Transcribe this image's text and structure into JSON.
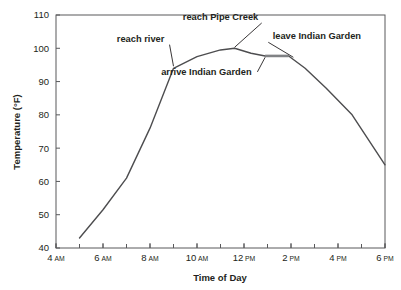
{
  "chart_data": {
    "type": "line",
    "title": "",
    "xlabel": "Time of Day",
    "ylabel": "Temperature (°F)",
    "ylim": [
      40,
      110
    ],
    "xlim": [
      4,
      18
    ],
    "grid": false,
    "legend": "none",
    "y_ticks": [
      40,
      50,
      60,
      70,
      80,
      90,
      100,
      110
    ],
    "y_tick_labels": [
      "40",
      "50",
      "60",
      "70",
      "80",
      "90",
      "100",
      "110"
    ],
    "x_ticks": [
      4,
      6,
      8,
      10,
      12,
      14,
      16,
      18
    ],
    "x_tick_labels": [
      {
        "num": "4",
        "suffix": "AM"
      },
      {
        "num": "6",
        "suffix": "AM"
      },
      {
        "num": "8",
        "suffix": "AM"
      },
      {
        "num": "10",
        "suffix": "AM"
      },
      {
        "num": "12",
        "suffix": "PM"
      },
      {
        "num": "2",
        "suffix": "PM"
      },
      {
        "num": "4",
        "suffix": "PM"
      },
      {
        "num": "6",
        "suffix": "PM"
      }
    ],
    "x_minor_tick_interval_hours": 1,
    "series": [
      {
        "name": "Temperature",
        "color": "#4d4d4f",
        "x": [
          5,
          6,
          7,
          8,
          9,
          10,
          11,
          11.6,
          12.3,
          12.9,
          13.9,
          14.6,
          15.5,
          16.6,
          18
        ],
        "y": [
          43,
          51.5,
          61,
          76,
          94,
          97.5,
          99.5,
          100,
          98.5,
          97.7,
          97.7,
          94,
          88,
          80,
          65
        ]
      }
    ],
    "highlight_segment": {
      "name": "at Indian Garden plateau",
      "color": "#808285",
      "x": [
        12.9,
        13.9
      ],
      "y": [
        97.7,
        97.7
      ]
    },
    "annotations": [
      {
        "id": "reach-pipe-creek",
        "text": "reach Pipe Creek",
        "label_x": 11.0,
        "label_y": 108.5,
        "point_x": 11.6,
        "point_y": 100.3
      },
      {
        "id": "reach-river",
        "text": "reach river",
        "label_x": 7.6,
        "label_y": 102.0,
        "point_x": 9.0,
        "point_y": 94.6
      },
      {
        "id": "arrive-indian-garden",
        "text": "arrive Indian Garden",
        "label_x": 10.4,
        "label_y": 92.0,
        "point_x": 12.9,
        "point_y": 97.3
      },
      {
        "id": "leave-indian-garden",
        "text": "leave Indian Garden",
        "label_x": 15.1,
        "label_y": 102.7,
        "point_x": 14.1,
        "point_y": 97.3
      }
    ]
  }
}
